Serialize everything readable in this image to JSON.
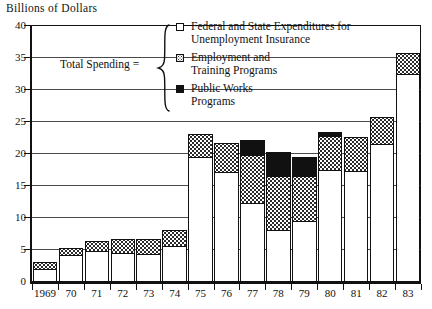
{
  "chart": {
    "axis_title": "Billions of Dollars",
    "y_ticks": [
      "0",
      "5",
      "10",
      "15",
      "20",
      "25",
      "30",
      "35",
      "40"
    ],
    "x_labels": [
      "1969",
      "70",
      "71",
      "72",
      "73",
      "74",
      "75",
      "76",
      "77",
      "78",
      "79",
      "80",
      "81",
      "82",
      "83"
    ]
  },
  "legend": {
    "equation_label": "Total Spending =",
    "brace_glyph": "brace-icon",
    "items": [
      {
        "key": "ui",
        "swatch": "white-open-square-swatch",
        "label": "Federal and State Expenditures for\nUnemployment Insurance"
      },
      {
        "key": "etp",
        "swatch": "dotted-square-swatch",
        "label": "Employment and\nTraining Programs"
      },
      {
        "key": "pw",
        "swatch": "black-filled-square-swatch",
        "label": "Public Works\nPrograms"
      }
    ]
  },
  "chart_data": {
    "type": "bar",
    "title": "",
    "subtitle": "",
    "xlabel": "",
    "ylabel": "Billions of Dollars",
    "ylim": [
      0,
      40
    ],
    "ytick_step": 5,
    "grid": true,
    "stacked": true,
    "legend_position": "top-center",
    "categories": [
      "1969",
      "70",
      "71",
      "72",
      "73",
      "74",
      "75",
      "76",
      "77",
      "78",
      "79",
      "80",
      "81",
      "82",
      "83"
    ],
    "series": [
      {
        "name": "Federal and State Expenditures for Unemployment Insurance",
        "key": "ui",
        "fill": "white",
        "values": [
          2.0,
          4.2,
          4.8,
          4.5,
          4.3,
          5.7,
          19.6,
          17.2,
          12.3,
          8.1,
          9.5,
          17.5,
          17.3,
          21.5,
          32.5
        ]
      },
      {
        "name": "Employment and Training Programs",
        "key": "etp",
        "fill": "dotted",
        "values": [
          1.3,
          1.3,
          1.8,
          2.3,
          2.5,
          2.6,
          3.7,
          4.6,
          7.7,
          8.7,
          7.2,
          5.5,
          5.5,
          4.5,
          3.5
        ]
      },
      {
        "name": "Public Works Programs",
        "key": "pw",
        "fill": "black",
        "values": [
          0.0,
          0.0,
          0.0,
          0.0,
          0.0,
          0.0,
          0.0,
          0.0,
          2.5,
          3.8,
          3.2,
          0.7,
          0.0,
          0.0,
          0.0
        ]
      }
    ],
    "totals": [
      3.3,
      5.5,
      6.6,
      6.8,
      6.8,
      8.3,
      23.3,
      21.8,
      22.5,
      20.6,
      19.9,
      23.7,
      22.8,
      26.0,
      36.0
    ]
  }
}
